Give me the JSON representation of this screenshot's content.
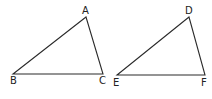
{
  "diagram": {
    "type": "geometry",
    "triangles": [
      {
        "name": "ABC",
        "vertices": [
          {
            "label": "A",
            "x": 86,
            "y": 17,
            "lx": 82,
            "ly": 14
          },
          {
            "label": "B",
            "x": 13,
            "y": 74,
            "lx": 10,
            "ly": 84
          },
          {
            "label": "C",
            "x": 103,
            "y": 74,
            "lx": 99,
            "ly": 84
          }
        ]
      },
      {
        "name": "DEF",
        "vertices": [
          {
            "label": "D",
            "x": 189,
            "y": 17,
            "lx": 185,
            "ly": 14
          },
          {
            "label": "E",
            "x": 117,
            "y": 75,
            "lx": 113,
            "ly": 86
          },
          {
            "label": "F",
            "x": 205,
            "y": 75,
            "lx": 201,
            "ly": 86
          }
        ]
      }
    ]
  }
}
